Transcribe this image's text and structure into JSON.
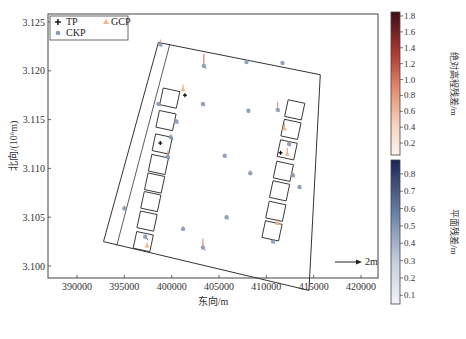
{
  "chart_data": {
    "type": "scatter",
    "title": "",
    "xlabel": "东向/m",
    "ylabel": "北向/(10⁶m)",
    "xlim": [
      387000,
      424500
    ],
    "ylim": [
      3.0965,
      3.1255
    ],
    "x_ticks": [
      390000,
      395000,
      400000,
      405000,
      410000,
      415000,
      420000
    ],
    "x_tick_labels": [
      "390000",
      "395000",
      "400000",
      "405000",
      "410000",
      "415000",
      "420000"
    ],
    "y_ticks": [
      3.1,
      3.105,
      3.11,
      3.115,
      3.12,
      3.125
    ],
    "y_tick_labels": [
      "3.100",
      "3.105",
      "3.110",
      "3.115",
      "3.120",
      "3.125"
    ],
    "grid": false,
    "legend": {
      "position": "upper left",
      "entries": [
        {
          "label": "TP",
          "marker": "plus",
          "color": "#000000"
        },
        {
          "label": "GCP",
          "marker": "triangle",
          "color": "#f2b58a"
        },
        {
          "label": "CKP",
          "marker": "circle",
          "color": "#8a9bb8"
        }
      ]
    },
    "scale_arrow": {
      "label": "2m",
      "length_m": 2
    },
    "colorbars": [
      {
        "label": "绝对高程残差/m",
        "ticks": [
          0.2,
          0.4,
          0.6,
          0.8,
          1.0,
          1.2,
          1.4,
          1.6,
          1.8
        ],
        "range": [
          0.05,
          1.85
        ],
        "cmap": "reds",
        "color_low": "#fbece2",
        "color_high": "#4a1018"
      },
      {
        "label": "平面残差/m",
        "ticks": [
          0.1,
          0.2,
          0.3,
          0.4,
          0.5,
          0.6,
          0.7,
          0.8
        ],
        "range": [
          0.05,
          0.88
        ],
        "cmap": "blues",
        "color_low": "#eef1f5",
        "color_high": "#1c2a5a"
      }
    ],
    "outer_boundary": [
      [
        392800,
        3.1025
      ],
      [
        398600,
        3.1229
      ],
      [
        415700,
        3.1196
      ],
      [
        414500,
        3.0975
      ],
      [
        392800,
        3.1025
      ]
    ],
    "inner_boundary_line": [
      [
        394200,
        3.1021
      ],
      [
        399800,
        3.1227
      ]
    ],
    "block_columns": {
      "left": [
        [
          399800,
          3.1172
        ],
        [
          399400,
          3.1149
        ],
        [
          399000,
          3.1125
        ],
        [
          398600,
          3.1104
        ],
        [
          398200,
          3.1085
        ],
        [
          397800,
          3.1066
        ],
        [
          397400,
          3.1046
        ],
        [
          397000,
          3.1025
        ]
      ],
      "right": [
        [
          413000,
          3.116
        ],
        [
          412600,
          3.114
        ],
        [
          412200,
          3.1119
        ],
        [
          411800,
          3.1097
        ],
        [
          411400,
          3.1077
        ],
        [
          411000,
          3.1056
        ],
        [
          410600,
          3.1036
        ]
      ]
    },
    "points": {
      "CKP": [
        {
          "x": 398800,
          "y": 3.1227,
          "dh": 0.5,
          "dxy": 0.4
        },
        {
          "x": 403400,
          "y": 3.1205,
          "dh": 1.2,
          "dxy": 0.5
        },
        {
          "x": 407900,
          "y": 3.1209,
          "dh": 0.3,
          "dxy": 0.3
        },
        {
          "x": 411700,
          "y": 3.1208,
          "dh": 0.2,
          "dxy": 0.3
        },
        {
          "x": 398600,
          "y": 3.1166,
          "dh": 0.2,
          "dxy": 0.3
        },
        {
          "x": 403300,
          "y": 3.1166,
          "dh": 0.2,
          "dxy": 0.4
        },
        {
          "x": 408100,
          "y": 3.1159,
          "dh": 0.2,
          "dxy": 0.3
        },
        {
          "x": 411200,
          "y": 3.116,
          "dh": 0.8,
          "dxy": 0.4
        },
        {
          "x": 400500,
          "y": 3.1148,
          "dh": 0.2,
          "dxy": 0.4
        },
        {
          "x": 405600,
          "y": 3.1113,
          "dh": 0.2,
          "dxy": 0.3
        },
        {
          "x": 408300,
          "y": 3.1095,
          "dh": 0.3,
          "dxy": 0.3
        },
        {
          "x": 413500,
          "y": 3.1081,
          "dh": 0.2,
          "dxy": 0.4
        },
        {
          "x": 395000,
          "y": 3.1059,
          "dh": 0.3,
          "dxy": 0.3
        },
        {
          "x": 401200,
          "y": 3.1038,
          "dh": 0.3,
          "dxy": 0.3
        },
        {
          "x": 403300,
          "y": 3.1019,
          "dh": 0.9,
          "dxy": 0.5
        },
        {
          "x": 405800,
          "y": 3.105,
          "dh": 0.2,
          "dxy": 0.4
        },
        {
          "x": 410700,
          "y": 3.1025,
          "dh": 0.2,
          "dxy": 0.3
        },
        {
          "x": 399600,
          "y": 3.1112,
          "dh": 0.6,
          "dxy": 0.4
        },
        {
          "x": 399900,
          "y": 3.1132,
          "dh": 0.3,
          "dxy": 0.5
        },
        {
          "x": 412400,
          "y": 3.1125,
          "dh": 0.3,
          "dxy": 0.4
        },
        {
          "x": 412800,
          "y": 3.1093,
          "dh": 0.3,
          "dxy": 0.4
        },
        {
          "x": 397200,
          "y": 3.103,
          "dh": 0.2,
          "dxy": 0.6
        }
      ],
      "GCP": [
        {
          "x": 401200,
          "y": 3.1181,
          "dh": 0.5
        },
        {
          "x": 397400,
          "y": 3.1021,
          "dh": 0.3
        },
        {
          "x": 411200,
          "y": 3.1044,
          "dh": 0.4
        },
        {
          "x": 411900,
          "y": 3.1141,
          "dh": 0.5
        },
        {
          "x": 412200,
          "y": 3.1115,
          "dh": 0.6
        }
      ],
      "TP": [
        {
          "x": 401400,
          "y": 3.1175
        },
        {
          "x": 398800,
          "y": 3.1126
        },
        {
          "x": 411500,
          "y": 3.1116
        }
      ]
    }
  },
  "labels": {
    "xlabel": "东向/m",
    "ylabel": "北向/(10⁶m)",
    "legend_tp": "TP",
    "legend_gcp": "GCP",
    "legend_ckp": "CKP",
    "scale": "2m",
    "cbar1_label": "绝对高程残差/m",
    "cbar2_label": "平面残差/m"
  }
}
